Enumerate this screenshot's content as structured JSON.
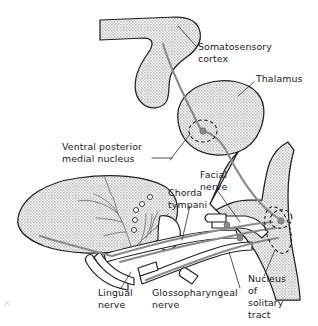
{
  "figure": {
    "background_color": "#ffffff",
    "ink_color": "#1f1f1f",
    "organ_fill_color": "#d9d9d9",
    "tract_color": "#8a8a8a",
    "label_font_size_px": 9.4
  },
  "labels": {
    "somatosensory_cortex_line1": "Somatosensory",
    "somatosensory_cortex_line2": "cortex",
    "thalamus": "Thalamus",
    "vpm_line1": "Ventral posterior",
    "vpm_line2": "medial nucleus",
    "facial_nerve_line1": "Facial",
    "facial_nerve_line2": "nerve",
    "chorda_tympani_line1": "Chorda",
    "chorda_tympani_line2": "tympani",
    "lingual_nerve_line1": "Lingual",
    "lingual_nerve_line2": "nerve",
    "glossopharyngeal_line1": "Glossopharyngeal",
    "glossopharyngeal_line2": "nerve",
    "solitary_line1": "Nucleus",
    "solitary_line2": "of",
    "solitary_line3": "solitary",
    "solitary_line4": "tract"
  },
  "structures": [
    {
      "name": "somatosensory-cortex",
      "kind": "shaded-organ"
    },
    {
      "name": "thalamus",
      "kind": "shaded-organ"
    },
    {
      "name": "brainstem",
      "kind": "shaded-organ"
    },
    {
      "name": "tongue",
      "kind": "shaded-organ"
    },
    {
      "name": "ventral-posterior-medial-nucleus",
      "kind": "dashed-nucleus"
    },
    {
      "name": "nucleus-of-solitary-tract",
      "kind": "dashed-nucleus"
    },
    {
      "name": "gustatory-tract",
      "kind": "nerve-tract"
    },
    {
      "name": "facial-nerve",
      "kind": "nerve-trunk"
    },
    {
      "name": "chorda-tympani",
      "kind": "nerve-trunk"
    },
    {
      "name": "lingual-nerve",
      "kind": "nerve-trunk"
    },
    {
      "name": "glossopharyngeal-nerve",
      "kind": "nerve-trunk"
    }
  ]
}
